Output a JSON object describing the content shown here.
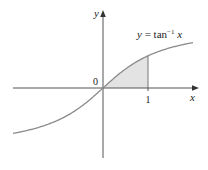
{
  "chart_data": {
    "type": "line",
    "title": "",
    "function_label": "y = tan⁻¹ x",
    "function_label_parts": {
      "lhs": "y",
      "eq": " = tan",
      "sup": "−1",
      "arg": " x"
    },
    "xlabel": "x",
    "ylabel": "y",
    "origin_label": "0",
    "x_ticks": [
      {
        "value": 1,
        "label": "1"
      }
    ],
    "xlim": [
      -2.0,
      2.1
    ],
    "ylim": [
      -1.7,
      1.9
    ],
    "series": [
      {
        "name": "arctan",
        "expression": "atan(x)",
        "x_range": [
          -2.0,
          2.0
        ]
      }
    ],
    "shaded_region": {
      "from_x": 0,
      "to_x": 1,
      "under": "atan(x)",
      "fill": "#e3e3e3"
    },
    "grid": false,
    "legend": "none",
    "colors": {
      "curve": "#8a8a8a",
      "axes": "#555555",
      "shade": "#e3e3e3"
    }
  }
}
